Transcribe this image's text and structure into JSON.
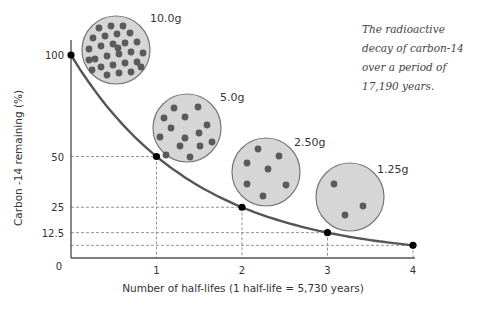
{
  "chart_data": {
    "type": "line",
    "title": "",
    "caption": "The radioactive decay of carbon-14 over a period of 17,190 years.",
    "xlabel": "Number of half-lifes (1 half-life = 5,730 years)",
    "ylabel": "Carbon -14 remaining (%)",
    "x": [
      0,
      1,
      2,
      3,
      4
    ],
    "series": [
      {
        "name": "Carbon-14 remaining",
        "values": [
          100,
          50,
          25,
          12.5,
          6.25
        ]
      }
    ],
    "x_ticks": [
      "1",
      "2",
      "3",
      "4"
    ],
    "y_ticks": [
      "0",
      "12.5",
      "25",
      "50",
      "100"
    ],
    "xlim": [
      0,
      4
    ],
    "ylim": [
      0,
      100
    ],
    "grid": false,
    "guide_lines": "dashed lines from each point to both axes",
    "sample_masses": [
      {
        "label": "10.0g",
        "dots": 28
      },
      {
        "label": "5.0g",
        "dots": 14
      },
      {
        "label": "2.50g",
        "dots": 7
      },
      {
        "label": "1.25g",
        "dots": 3
      }
    ],
    "legend": null
  },
  "colors": {
    "curve": "#555555",
    "point": "#000000",
    "circle_fill": "#d6d6d6",
    "circle_stroke": "#777777",
    "dot": "#5a5a5a",
    "axis": "#555555",
    "guide": "#888888"
  }
}
